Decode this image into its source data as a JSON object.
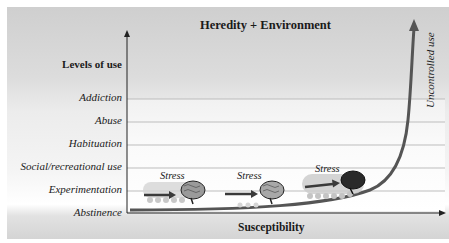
{
  "title": "Heredity + Environment",
  "y_axis": {
    "label": "Levels of use",
    "levels": [
      {
        "label": "Addiction",
        "y": 98
      },
      {
        "label": "Abuse",
        "y": 121
      },
      {
        "label": "Habituation",
        "y": 144
      },
      {
        "label": "Social/recreational use",
        "y": 167
      },
      {
        "label": "Experimentation",
        "y": 190
      },
      {
        "label": "Abstinence",
        "y": 212
      }
    ]
  },
  "x_axis": {
    "label": "Susceptibility"
  },
  "curve": {
    "label": "Uncontrolled use",
    "color": "#555555"
  },
  "stress_stages": [
    {
      "label": "Stress",
      "x": 160,
      "y": 171,
      "brain_shade": "light"
    },
    {
      "label": "Stress",
      "x": 237,
      "y": 171,
      "brain_shade": "light"
    },
    {
      "label": "Stress",
      "x": 315,
      "y": 164,
      "brain_shade": "dark"
    }
  ],
  "colors": {
    "grid": "#bdbdbd",
    "axis": "#222222",
    "arrow": "#3a3a3a"
  }
}
